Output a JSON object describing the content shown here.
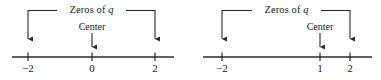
{
  "figure": {
    "type": "number-line-diagram-pair",
    "background_color": "#ffffff",
    "ink_color": "#2b2b2b",
    "text_color": "#1a1a1a"
  },
  "diagrams": [
    {
      "id": "left",
      "zeros_label": "Zeros of ",
      "zeros_label_var": "q",
      "center_label": "Center",
      "axis": {
        "x_start": 12,
        "x_end": 174,
        "y": 57
      },
      "bracket": {
        "y": 10,
        "left_x": 28,
        "right_x": 155,
        "arrow_tip_y": 45
      },
      "center_marker": {
        "x": 92,
        "arrow_top_y": 33,
        "arrow_tip_y": 52
      },
      "ticks": [
        {
          "label": "−2",
          "x": 28,
          "value": -2
        },
        {
          "label": "0",
          "x": 92,
          "value": 0
        },
        {
          "label": "2",
          "x": 155,
          "value": 2
        }
      ],
      "zeros": [
        -2,
        2
      ],
      "center": 0
    },
    {
      "id": "right",
      "zeros_label": "Zeros of ",
      "zeros_label_var": "q",
      "center_label": "Center",
      "axis": {
        "x_start": 203,
        "x_end": 372,
        "y": 57
      },
      "bracket": {
        "y": 10,
        "left_x": 222,
        "right_x": 350,
        "arrow_tip_y": 45
      },
      "center_marker": {
        "x": 320,
        "arrow_top_y": 33,
        "arrow_tip_y": 52
      },
      "ticks": [
        {
          "label": "−2",
          "x": 222,
          "value": -2
        },
        {
          "label": "1",
          "x": 320,
          "value": 1
        },
        {
          "label": "2",
          "x": 350,
          "value": 2
        }
      ],
      "zeros": [
        -2,
        2
      ],
      "center": 1
    }
  ]
}
